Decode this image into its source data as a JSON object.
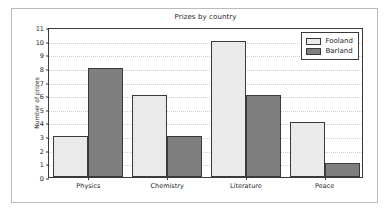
{
  "chart_data": {
    "type": "bar",
    "title": "Prizes by country",
    "xlabel": "",
    "ylabel": "Number of prizes",
    "categories": [
      "Physics",
      "Chemistry",
      "Literature",
      "Peace"
    ],
    "series": [
      {
        "name": "Fooland",
        "values": [
          3,
          6,
          10,
          4
        ],
        "color": "#eaeaea"
      },
      {
        "name": "Barland",
        "values": [
          8,
          3,
          6,
          1
        ],
        "color": "#7f7f7f"
      }
    ],
    "ylim": [
      0,
      11
    ],
    "yticks": [
      0,
      1,
      2,
      3,
      4,
      5,
      6,
      7,
      8,
      9,
      10,
      11
    ],
    "grid": true,
    "legend_position": "upper right"
  }
}
